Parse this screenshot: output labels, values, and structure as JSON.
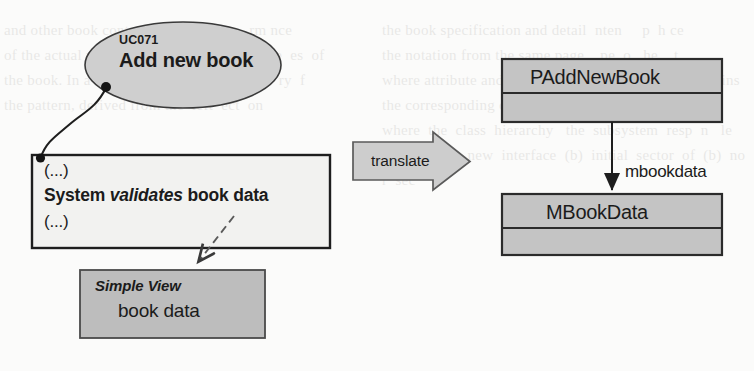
{
  "diagram": {
    "usecase": {
      "id": "UC071",
      "name": "Add new book",
      "shape": "ellipse",
      "fill": "#cfcfcf",
      "stroke": "#3a3a3a"
    },
    "note": {
      "line1": "(...)",
      "sentence_subject": "System",
      "sentence_verb": "validates",
      "sentence_object": "book data",
      "line3": "(...)",
      "fill": "#f2f2f0",
      "stroke": "#1e1e1e"
    },
    "simple_view": {
      "stereotype": "Simple View",
      "name": "book data",
      "fill": "#bdbdbd",
      "stroke": "#4a4a4a"
    },
    "translate_arrow": {
      "label": "translate",
      "fill": "#cdcdcd",
      "stroke": "#5a5a5a",
      "direction": "right"
    },
    "classes": [
      {
        "name": "PAddNewBook",
        "fill": "#c4c4c4",
        "stroke": "#2b2b2b",
        "compartments": 2
      },
      {
        "name": "MBookData",
        "fill": "#c4c4c4",
        "stroke": "#2b2b2b",
        "compartments": 2
      }
    ],
    "association": {
      "label": "mbookdata",
      "from": "PAddNewBook",
      "to": "MBookData",
      "style": "solid-arrow"
    },
    "connectors": [
      {
        "name": "usecase-to-note",
        "style": "curved-solid",
        "endpoints": "filled-dots"
      },
      {
        "name": "note-to-simple-view",
        "style": "dashed-arrow"
      }
    ],
    "background_color": "#fbfbfa"
  },
  "ghost_text": {
    "left": "and other book content to see  it the p  rm nce\nof the actual page from the same  p  e for t e  es  of\nthe book. In a few  UML designation  s  m  ry  f\nthe pattern, derived from the  left  ect  on",
    "right": "the book specification and detail  nten     p  h ce\nthe notation from the same page    pe  o   he    t\nwhere attribute and the   UML  C  se  whether one m  ins\nthe corresponding of the  proper.  The b  tom  l  n   d\nwhere  the  class  hierarchy   the  subsystem  resp  n   le\nfor handling  new  interface  (b)  initial  sector  of  (b)  no r  sec"
  }
}
